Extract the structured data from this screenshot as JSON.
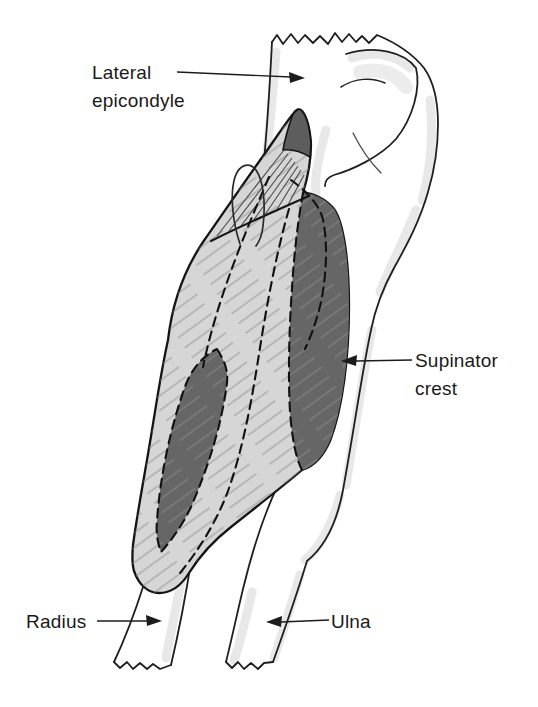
{
  "labels": {
    "lateral_epicondyle": "Lateral epicondyle",
    "supinator_crest": "Supinator crest",
    "radius": "Radius",
    "ulna": "Ulna"
  },
  "colors": {
    "background": "#ffffff",
    "outline": "#1f1f1f",
    "muscle_light": "#d6d6d6",
    "muscle_dark": "#666666",
    "tendon_dark": "#5d5d5d",
    "bone_shading": "#e8e8e8",
    "hatch_line": "#8d8d8d",
    "label_text": "#1a1a1a"
  }
}
